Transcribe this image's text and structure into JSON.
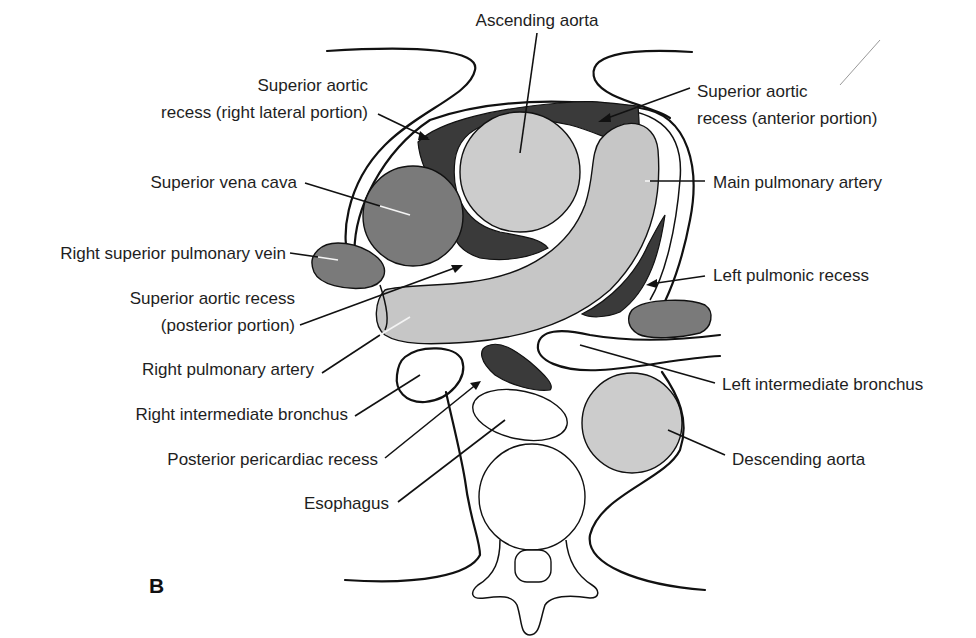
{
  "panel_letter": "B",
  "colors": {
    "background": "#ffffff",
    "outline": "#111111",
    "recess_dark": "#3a3a3a",
    "vein_medium": "#7a7a7a",
    "artery_light": "#c6c6c6",
    "text": "#1e1e1e"
  },
  "labels": {
    "ascending_aorta": "Ascending aorta",
    "sar_right_lateral_1": "Superior aortic",
    "sar_right_lateral_2": "recess (right lateral portion)",
    "sar_anterior_1": "Superior aortic",
    "sar_anterior_2": "recess (anterior portion)",
    "svc": "Superior vena cava",
    "main_pa": "Main pulmonary artery",
    "rspv": "Right superior pulmonary vein",
    "left_pulmonic_recess": "Left pulmonic recess",
    "sar_posterior_1": "Superior aortic recess",
    "sar_posterior_2": "(posterior portion)",
    "right_pa": "Right pulmonary artery",
    "left_int_bronchus": "Left intermediate bronchus",
    "right_int_bronchus": "Right intermediate bronchus",
    "posterior_pericardiac_recess": "Posterior pericardiac recess",
    "descending_aorta": "Descending aorta",
    "esophagus": "Esophagus"
  }
}
